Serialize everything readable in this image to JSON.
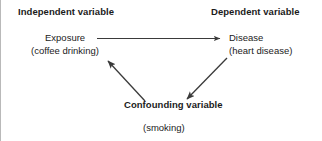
{
  "figure": {
    "type": "confounding-variable-diagram",
    "background_color": "#ffffff",
    "text_color": "#1b1b1b",
    "line_color": "#3a3a3a",
    "border_color": "#b9b9b9"
  },
  "headings": {
    "independent": "Independent variable",
    "dependent": "Dependent variable",
    "confounding": "Confounding variable"
  },
  "nodes": {
    "exposure": {
      "label": "Exposure",
      "example": "(coffee drinking)"
    },
    "disease": {
      "label": "Disease",
      "example": "(heart disease)"
    },
    "confounder": {
      "example": "(smoking)"
    }
  },
  "arrows": [
    {
      "name": "exposure-to-disease",
      "from": "Exposure",
      "to": "Disease",
      "direction": "right",
      "style": "straight-horizontal"
    },
    {
      "name": "confounder-to-exposure",
      "from": "Confounding variable",
      "to": "Exposure",
      "direction": "up-left",
      "style": "straight-diagonal"
    },
    {
      "name": "confounder-to-disease",
      "from": "Confounding variable",
      "to": "Disease",
      "direction": "down-left",
      "style": "straight-diagonal"
    }
  ]
}
